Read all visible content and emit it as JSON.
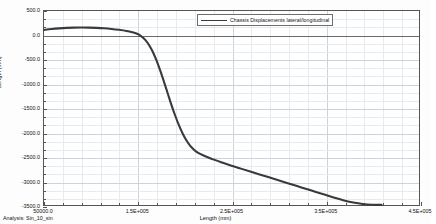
{
  "chart_data": {
    "type": "line",
    "title": "",
    "xlabel": "Length (mm)",
    "ylabel": "Length (mm)",
    "xlim": [
      50000,
      450000
    ],
    "ylim": [
      -3500,
      500
    ],
    "grid": true,
    "legend_position": "top-center",
    "xticks": [
      {
        "value": 50000,
        "label": "50000.0"
      },
      {
        "value": 150000,
        "label": "1.5E+005"
      },
      {
        "value": 250000,
        "label": "2.5E+005"
      },
      {
        "value": 350000,
        "label": "3.5E+005"
      },
      {
        "value": 450000,
        "label": "4.5E+005"
      }
    ],
    "yticks": [
      {
        "value": 500,
        "label": "500.0"
      },
      {
        "value": 0,
        "label": "0.0"
      },
      {
        "value": -500,
        "label": "-500.0"
      },
      {
        "value": -1000,
        "label": "-1000.0"
      },
      {
        "value": -1500,
        "label": "-1500.0"
      },
      {
        "value": -2000,
        "label": "-2000.0"
      },
      {
        "value": -2500,
        "label": "-2500.0"
      },
      {
        "value": -3000,
        "label": "-3000.0"
      },
      {
        "value": -3500,
        "label": "-3500.0"
      }
    ],
    "xminor_count": 4,
    "yminor_count": 2,
    "zero_line": 0,
    "series": [
      {
        "name": "Chassis Displacements lateral/longitudinal",
        "color": "#3a3a3a",
        "width": 2.1,
        "points": [
          [
            50000,
            110
          ],
          [
            58000,
            128
          ],
          [
            66000,
            142
          ],
          [
            74000,
            152
          ],
          [
            82000,
            158
          ],
          [
            90000,
            160
          ],
          [
            98000,
            158
          ],
          [
            106000,
            152
          ],
          [
            114000,
            143
          ],
          [
            122000,
            130
          ],
          [
            130000,
            112
          ],
          [
            138000,
            88
          ],
          [
            144000,
            62
          ],
          [
            150000,
            25
          ],
          [
            154000,
            -25
          ],
          [
            158000,
            -95
          ],
          [
            162000,
            -200
          ],
          [
            166000,
            -340
          ],
          [
            170000,
            -520
          ],
          [
            174000,
            -730
          ],
          [
            178000,
            -960
          ],
          [
            182000,
            -1200
          ],
          [
            186000,
            -1440
          ],
          [
            190000,
            -1660
          ],
          [
            194000,
            -1860
          ],
          [
            198000,
            -2030
          ],
          [
            202000,
            -2170
          ],
          [
            206000,
            -2280
          ],
          [
            210000,
            -2360
          ],
          [
            214000,
            -2420
          ],
          [
            218000,
            -2460
          ],
          [
            224000,
            -2510
          ],
          [
            232000,
            -2570
          ],
          [
            240000,
            -2625
          ],
          [
            250000,
            -2690
          ],
          [
            260000,
            -2750
          ],
          [
            270000,
            -2810
          ],
          [
            280000,
            -2870
          ],
          [
            290000,
            -2930
          ],
          [
            300000,
            -2990
          ],
          [
            310000,
            -3050
          ],
          [
            320000,
            -3110
          ],
          [
            330000,
            -3170
          ],
          [
            340000,
            -3230
          ],
          [
            350000,
            -3290
          ],
          [
            360000,
            -3350
          ],
          [
            370000,
            -3405
          ],
          [
            380000,
            -3450
          ],
          [
            390000,
            -3480
          ],
          [
            400000,
            -3495
          ],
          [
            410000,
            -3498
          ]
        ]
      }
    ]
  },
  "footer": {
    "analysis_label": "Analysis:  Sin_10_sin"
  },
  "legend": {
    "entries": [
      {
        "label": "Chassis Displacements lateral/longitudinal"
      }
    ]
  }
}
